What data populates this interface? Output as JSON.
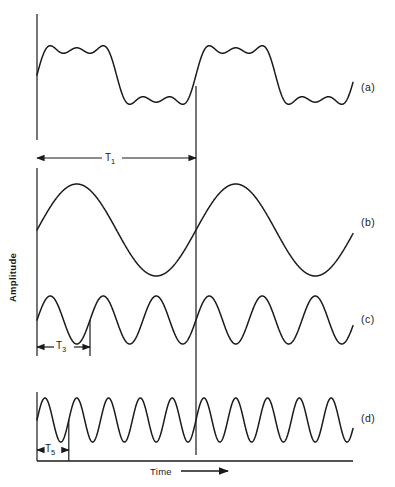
{
  "figure": {
    "title": "",
    "background_color": "#ffffff",
    "stroke_color": "#1a1a1a"
  },
  "axes": {
    "y_title": "Amplitude",
    "x_title": "Time",
    "x_arrow_icon": "right-arrow-icon"
  },
  "traces": [
    {
      "key": "a",
      "label": "(a)"
    },
    {
      "key": "b",
      "label": "(b)"
    },
    {
      "key": "c",
      "label": "(c)"
    },
    {
      "key": "d",
      "label": "(d)"
    }
  ],
  "period_markers": [
    {
      "key": "T1",
      "base": "T",
      "sub": "1",
      "trace": "a"
    },
    {
      "key": "T3",
      "base": "T",
      "sub": "3",
      "trace": "c"
    },
    {
      "key": "T5",
      "base": "T",
      "sub": "5",
      "trace": "d"
    }
  ],
  "chart_data": {
    "type": "line",
    "title": "",
    "xlabel": "Time",
    "ylabel": "Amplitude",
    "grid": false,
    "legend_position": "right",
    "axis_ticks": false,
    "x": [
      0,
      1
    ],
    "xlim": [
      0,
      1
    ],
    "ylim": [
      -1.6,
      1.6
    ],
    "fundamental_period_units": 1,
    "series": [
      {
        "name": "(a)",
        "role": "composite-sum",
        "harmonics": [
          1,
          3,
          5
        ],
        "amplitudes": [
          1.0,
          0.3333,
          0.2
        ],
        "cycles_per_T1": 1,
        "period_label": "T1",
        "amplitude_peak": 1.53
      },
      {
        "name": "(b)",
        "role": "fundamental",
        "harmonic": 1,
        "amplitude": 1.0,
        "cycles_per_T1": 1,
        "period_label": "T1"
      },
      {
        "name": "(c)",
        "role": "third-harmonic",
        "harmonic": 3,
        "amplitude": 0.3333,
        "cycles_per_T1": 3,
        "period_label": "T3"
      },
      {
        "name": "(d)",
        "role": "fifth-harmonic",
        "harmonic": 5,
        "amplitude": 0.2,
        "cycles_per_T1": 5,
        "period_label": "T5"
      }
    ]
  }
}
